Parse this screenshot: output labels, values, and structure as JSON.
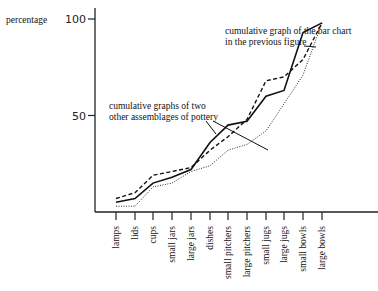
{
  "chart_data": {
    "type": "line",
    "title": "",
    "ylabel": "percentage",
    "xlabel": "",
    "ylim": [
      0,
      100
    ],
    "yticks": [
      50,
      100
    ],
    "ytick_labels": [
      "50",
      "100"
    ],
    "grid": false,
    "categories": [
      "lamps",
      "lids",
      "cups",
      "small jars",
      "large jars",
      "dishes",
      "small pitchers",
      "large pitchers",
      "small jugs",
      "large jugs",
      "small bowls",
      "large bowls"
    ],
    "series": [
      {
        "name": "cumulative graph of the bar chart in the previous figure",
        "style": "solid",
        "values": [
          5,
          7,
          15,
          18,
          22,
          36,
          45,
          47,
          60,
          63,
          93,
          98
        ]
      },
      {
        "name": "other assemblage of pottery A",
        "style": "dashed",
        "values": [
          7,
          10,
          19,
          21,
          23,
          32,
          39,
          48,
          68,
          70,
          79,
          98
        ]
      },
      {
        "name": "other assemblage of pottery B",
        "style": "dotted",
        "values": [
          3,
          3,
          13,
          15,
          21,
          24,
          32,
          35,
          42,
          56,
          71,
          98
        ]
      }
    ],
    "annotations": [
      {
        "lines": [
          "cumulative graph of the bar chart",
          "in the previous figure"
        ],
        "target": "solid"
      },
      {
        "lines": [
          "cumulative graphs of two",
          "other assemblages of pottery"
        ],
        "target": "dashed and dotted"
      }
    ]
  },
  "colors": {
    "ink": "#111111",
    "background": "#ffffff"
  }
}
